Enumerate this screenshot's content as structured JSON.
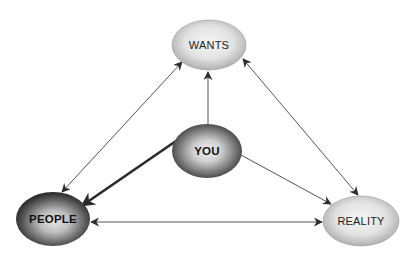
{
  "diagram": {
    "type": "relationship-triangle",
    "nodes": [
      {
        "id": "wants",
        "label": "WANTS",
        "cx": 209,
        "cy": 45,
        "rx": 37,
        "ry": 25,
        "style": "light"
      },
      {
        "id": "you",
        "label": "YOU",
        "cx": 207,
        "cy": 151,
        "rx": 35,
        "ry": 27,
        "style": "dark-center"
      },
      {
        "id": "people",
        "label": "PEOPLE",
        "cx": 53,
        "cy": 219,
        "rx": 37,
        "ry": 27,
        "style": "dark"
      },
      {
        "id": "reality",
        "label": "REALITY",
        "cx": 361,
        "cy": 221,
        "rx": 38,
        "ry": 25,
        "style": "light"
      }
    ],
    "edges": [
      {
        "from": "wants",
        "to": "people",
        "direction": "both",
        "weight": "thin"
      },
      {
        "from": "wants",
        "to": "reality",
        "direction": "both",
        "weight": "thin"
      },
      {
        "from": "people",
        "to": "reality",
        "direction": "both",
        "weight": "thin"
      },
      {
        "from": "you",
        "to": "wants",
        "direction": "forward",
        "weight": "thin"
      },
      {
        "from": "you",
        "to": "people",
        "direction": "forward",
        "weight": "thick"
      },
      {
        "from": "you",
        "to": "reality",
        "direction": "forward",
        "weight": "thin"
      }
    ],
    "colors": {
      "line": "#3a3a3a",
      "light_fill_center": "#f4f4f4",
      "light_fill_edge": "#a9a9a9",
      "dark_fill_center": "#dcdcdc",
      "dark_fill_edge": "#1e1e1e",
      "text_dark": "#222222",
      "text_bold": "#111111"
    }
  }
}
